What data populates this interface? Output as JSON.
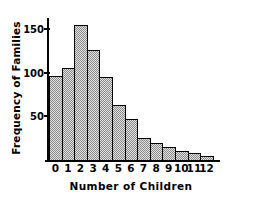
{
  "chart_data": {
    "type": "bar",
    "title": "",
    "subtitle": "",
    "xlabel": "Number of Children",
    "ylabel": "Frequency of Families",
    "categories": [
      "0",
      "1",
      "2",
      "3",
      "4",
      "5",
      "6",
      "7",
      "8",
      "9",
      "10",
      "11",
      "12"
    ],
    "values": [
      96,
      105,
      155,
      126,
      95,
      63,
      47,
      25,
      20,
      15,
      10,
      8,
      5
    ],
    "xlim": [
      -0.5,
      12.5
    ],
    "ylim": [
      0,
      165
    ],
    "ytick_labels": [
      "50",
      "100",
      "150"
    ],
    "ytick_values": [
      50,
      100,
      150
    ],
    "xtick_labels": [
      "0",
      "1",
      "2",
      "3",
      "4",
      "5",
      "6",
      "7",
      "8",
      "9",
      "10",
      "11",
      "12"
    ],
    "grid": false,
    "legend": null,
    "legend_position": "none",
    "bar_fill_color": "#b9b9b9",
    "bar_edge_color": "#000000",
    "axis_color": "#000000",
    "background_color": "#ffffff",
    "annotations": []
  }
}
